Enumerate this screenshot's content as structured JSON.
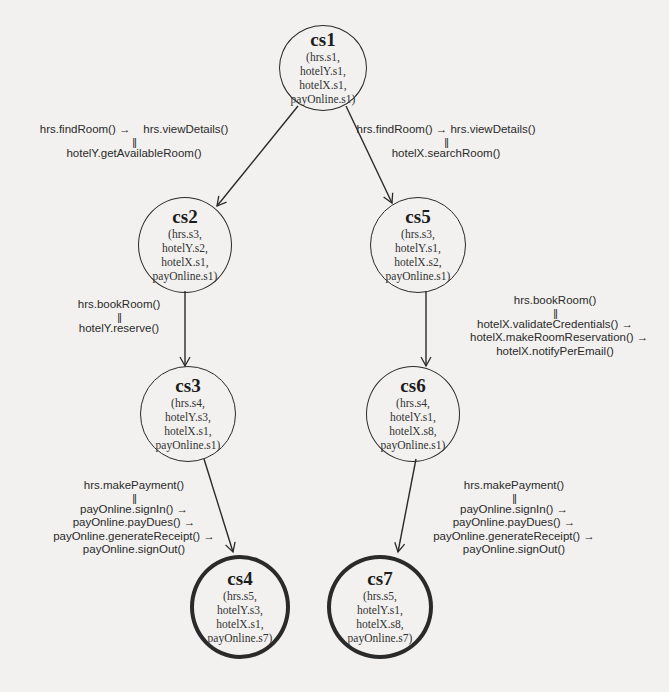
{
  "diagram": {
    "type": "state-transition-graph",
    "nodes": [
      {
        "id": "cs1",
        "state": [
          "(hrs.s1,",
          "hotelY.s1,",
          "hotelX.s1,",
          "payOnline.s1)"
        ],
        "final": false
      },
      {
        "id": "cs2",
        "state": [
          "(hrs.s3,",
          "hotelY.s2,",
          "hotelX.s1,",
          "payOnline.s1)"
        ],
        "final": false
      },
      {
        "id": "cs5",
        "state": [
          "(hrs.s3,",
          "hotelY.s1,",
          "hotelX.s2,",
          "payOnline.s1)"
        ],
        "final": false
      },
      {
        "id": "cs3",
        "state": [
          "(hrs.s4,",
          "hotelY.s3,",
          "hotelX.s1,",
          "payOnline.s1)"
        ],
        "final": false
      },
      {
        "id": "cs6",
        "state": [
          "(hrs.s4,",
          "hotelY.s1,",
          "hotelX.s8,",
          "payOnline.s1)"
        ],
        "final": false
      },
      {
        "id": "cs4",
        "state": [
          "(hrs.s5,",
          "hotelY.s3,",
          "hotelX.s1,",
          "payOnline.s7)"
        ],
        "final": true
      },
      {
        "id": "cs7",
        "state": [
          "(hrs.s5,",
          "hotelY.s1,",
          "hotelX.s8,",
          "payOnline.s7)"
        ],
        "final": true
      }
    ],
    "edges": [
      {
        "from": "cs1",
        "to": "cs2",
        "label": {
          "top": "hrs.findRoom() →    hrs.viewDetails()",
          "parallel": "||",
          "bottom": [
            "hotelY.getAvailableRoom()"
          ]
        }
      },
      {
        "from": "cs1",
        "to": "cs5",
        "label": {
          "top": "hrs.findRoom() → hrs.viewDetails()",
          "parallel": "||",
          "bottom": [
            "hotelX.searchRoom()"
          ]
        }
      },
      {
        "from": "cs2",
        "to": "cs3",
        "label": {
          "top": "hrs.bookRoom()",
          "parallel": "||",
          "bottom": [
            "hotelY.reserve()"
          ]
        }
      },
      {
        "from": "cs5",
        "to": "cs6",
        "label": {
          "top": "hrs.bookRoom()",
          "parallel": "||",
          "bottom": [
            "hotelX.validateCredentials() →",
            "hotelX.makeRoomReservation() →",
            "hotelX.notifyPerEmail()"
          ]
        }
      },
      {
        "from": "cs3",
        "to": "cs4",
        "label": {
          "top": "hrs.makePayment()",
          "parallel": "||",
          "bottom": [
            "payOnline.signIn() →",
            "payOnline.payDues() →",
            "payOnline.generateReceipt() →",
            "payOnline.signOut()"
          ]
        }
      },
      {
        "from": "cs6",
        "to": "cs7",
        "label": {
          "top": "hrs.makePayment()",
          "parallel": "||",
          "bottom": [
            "payOnline.signIn() →",
            "payOnline.payDues() →",
            "payOnline.generateReceipt() →",
            "payOnline.signOut()"
          ]
        }
      }
    ]
  },
  "colors": {
    "background": "#f2f1ef",
    "stroke": "#2a2a2a",
    "text": "#222222"
  }
}
